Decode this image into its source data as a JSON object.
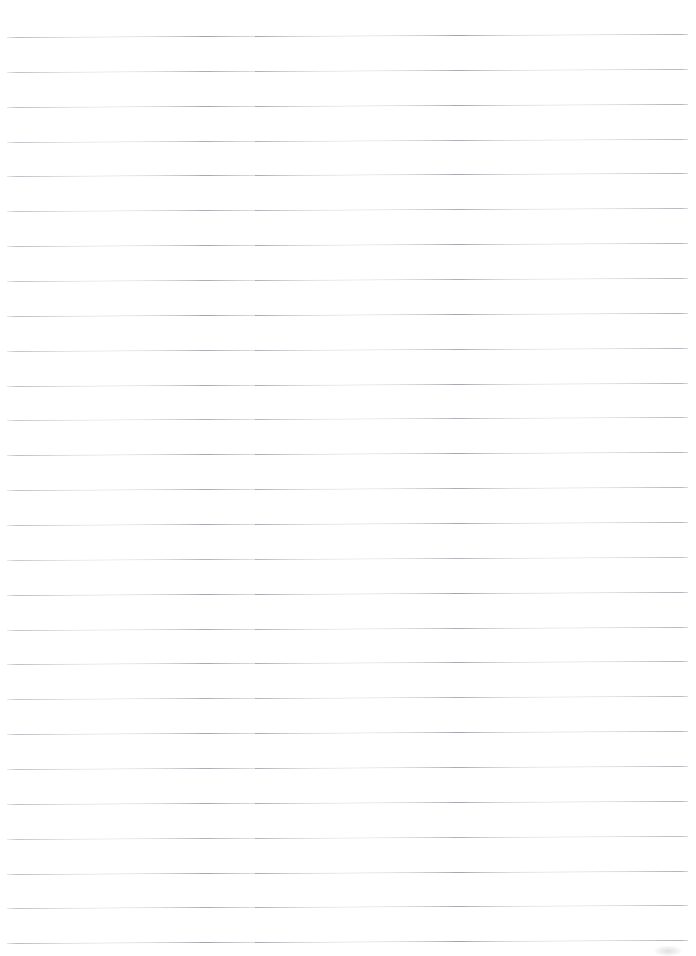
{
  "page": {
    "kind": "ruled-notebook-paper",
    "width": 696,
    "height": 956,
    "background_color": "#ffffff",
    "content_text": ""
  },
  "ruling": {
    "line_color": "#a3a7ac",
    "line_thickness_px": 1,
    "line_count": 27,
    "first_line_y": 37,
    "line_spacing_px": 34.85,
    "line_start_x": 7,
    "line_end_x": 688,
    "line_length_px": 681,
    "tilt_degrees": -0.26,
    "margin_rule": "none",
    "left_margin_line": false,
    "header_line": false
  },
  "lines": [
    {
      "index": 1,
      "y": 37,
      "color": "#9ea2a7",
      "opacity": 0.95
    },
    {
      "index": 2,
      "y": 72,
      "color": "#a3a7ac",
      "opacity": 0.92
    },
    {
      "index": 3,
      "y": 107,
      "color": "#a1a5aa",
      "opacity": 0.94
    },
    {
      "index": 4,
      "y": 142,
      "color": "#a5a9ae",
      "opacity": 0.9
    },
    {
      "index": 5,
      "y": 176,
      "color": "#a0a4a9",
      "opacity": 0.93
    },
    {
      "index": 6,
      "y": 211,
      "color": "#a4a8ad",
      "opacity": 0.91
    },
    {
      "index": 7,
      "y": 246,
      "color": "#a1a5aa",
      "opacity": 0.94
    },
    {
      "index": 8,
      "y": 281,
      "color": "#a5a9ae",
      "opacity": 0.9
    },
    {
      "index": 9,
      "y": 316,
      "color": "#9fa3a8",
      "opacity": 0.95
    },
    {
      "index": 10,
      "y": 351,
      "color": "#a4a8ad",
      "opacity": 0.91
    },
    {
      "index": 11,
      "y": 386,
      "color": "#a2a6ab",
      "opacity": 0.93
    },
    {
      "index": 12,
      "y": 420,
      "color": "#a6aaaf",
      "opacity": 0.88
    },
    {
      "index": 13,
      "y": 455,
      "color": "#a0a4a9",
      "opacity": 0.94
    },
    {
      "index": 14,
      "y": 490,
      "color": "#a3a7ac",
      "opacity": 0.92
    },
    {
      "index": 15,
      "y": 525,
      "color": "#a1a5aa",
      "opacity": 0.93
    },
    {
      "index": 16,
      "y": 560,
      "color": "#a7abb0",
      "opacity": 0.86
    },
    {
      "index": 17,
      "y": 595,
      "color": "#9fa3a8",
      "opacity": 0.95
    },
    {
      "index": 18,
      "y": 630,
      "color": "#a4a8ad",
      "opacity": 0.91
    },
    {
      "index": 19,
      "y": 664,
      "color": "#a2a6ab",
      "opacity": 0.93
    },
    {
      "index": 20,
      "y": 699,
      "color": "#a5a9ae",
      "opacity": 0.89
    },
    {
      "index": 21,
      "y": 734,
      "color": "#a0a4a9",
      "opacity": 0.94
    },
    {
      "index": 22,
      "y": 769,
      "color": "#a3a7ac",
      "opacity": 0.92
    },
    {
      "index": 23,
      "y": 804,
      "color": "#a1a5aa",
      "opacity": 0.93
    },
    {
      "index": 24,
      "y": 839,
      "color": "#a6aaaf",
      "opacity": 0.88
    },
    {
      "index": 25,
      "y": 874,
      "color": "#a0a4a9",
      "opacity": 0.94
    },
    {
      "index": 26,
      "y": 908,
      "color": "#a3a7ac",
      "opacity": 0.92
    },
    {
      "index": 27,
      "y": 943,
      "color": "#9ea2a7",
      "opacity": 0.95
    }
  ],
  "marks": [
    {
      "name": "corner-smudge",
      "x": 655,
      "y": 946,
      "width": 26,
      "height": 10
    }
  ]
}
